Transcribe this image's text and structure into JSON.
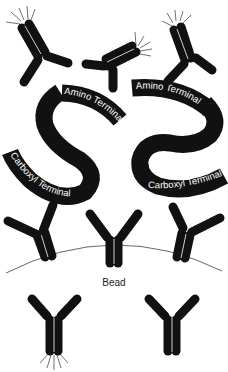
{
  "diagram": {
    "type": "sandwich-immunoassay-illustration",
    "colors": {
      "ink": "#111111",
      "background": "#ffffff",
      "bead_outline": "#555555"
    },
    "labels": {
      "amino_left": "Amino Terminal",
      "amino_right": "Amino Terminal",
      "carboxyl_left": "Carboxyl Terminal",
      "carboxyl_right": "Carboxyl Terminal",
      "bead": "Bead"
    },
    "elements": [
      {
        "name": "labeled-antibody-top-left",
        "glyph": "Y-shape with emission rays"
      },
      {
        "name": "labeled-antibody-top-center",
        "glyph": "Y-shape with emission rays"
      },
      {
        "name": "labeled-antibody-top-right",
        "glyph": "Y-shape with emission rays"
      },
      {
        "name": "antigen-ribbon-left",
        "glyph": "S-shaped ribbon"
      },
      {
        "name": "antigen-ribbon-right",
        "glyph": "S-shaped ribbon"
      },
      {
        "name": "capture-antibody-left",
        "glyph": "Y-shape on bead"
      },
      {
        "name": "capture-antibody-center",
        "glyph": "Y-shape on bead"
      },
      {
        "name": "capture-antibody-right",
        "glyph": "Y-shape on bead"
      },
      {
        "name": "bead-surface",
        "glyph": "arc"
      },
      {
        "name": "free-labeled-antibody",
        "glyph": "Y-shape with emission rays"
      },
      {
        "name": "free-unlabeled-antibody",
        "glyph": "Y-shape"
      }
    ]
  }
}
